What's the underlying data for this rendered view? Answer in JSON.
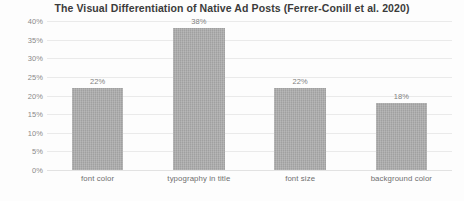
{
  "chart_data": {
    "type": "bar",
    "title": "The Visual Differentiation of Native Ad Posts (Ferrer-Conill et al. 2020)",
    "xlabel": "",
    "ylabel": "",
    "categories": [
      "font color",
      "typography in title",
      "font size",
      "background color"
    ],
    "values": [
      22,
      38,
      22,
      18
    ],
    "data_labels": [
      "22%",
      "38%",
      "22%",
      "18%"
    ],
    "ylim": [
      0,
      40
    ],
    "y_ticks": [
      0,
      5,
      10,
      15,
      20,
      25,
      30,
      35,
      40
    ],
    "y_tick_labels": [
      "0%",
      "5%",
      "10%",
      "15%",
      "20%",
      "25%",
      "30%",
      "35%",
      "40%"
    ],
    "grid": true,
    "legend": false,
    "bar_color": "#a3a3a3",
    "gridline_color": "#eaeaea",
    "title_color": "#3b3b3b",
    "label_color": "#7f7f7f",
    "background_color": "#fdfdfd"
  }
}
